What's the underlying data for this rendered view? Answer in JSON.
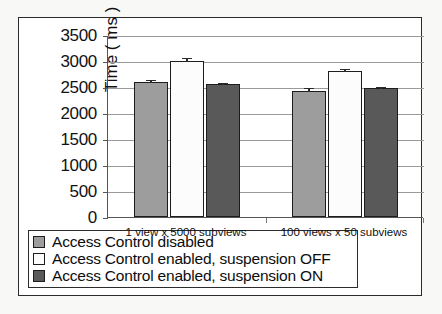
{
  "chart_data": {
    "type": "bar",
    "title": "",
    "xlabel": "",
    "ylabel": "Time ( ms )",
    "ylim": [
      0,
      3500
    ],
    "ytick_step": 500,
    "yticks": [
      "3500",
      "3000",
      "2500",
      "2000",
      "1500",
      "1000",
      "500",
      "0"
    ],
    "grid": true,
    "legend_position": "below-plot",
    "categories": [
      "1 view x 5000 subviews",
      "100 views x 50 subviews"
    ],
    "series": [
      {
        "name": "Access Control disabled",
        "color": "#9d9d9d",
        "values": [
          2600,
          2430
        ],
        "errors": [
          60,
          75
        ]
      },
      {
        "name": "Access Control enabled, suspension OFF",
        "color": "#fcfcfc",
        "values": [
          3000,
          2800
        ],
        "errors": [
          75,
          65
        ]
      },
      {
        "name": "Access Control enabled, suspension ON",
        "color": "#595959",
        "values": [
          2550,
          2480
        ],
        "errors": [
          45,
          40
        ]
      }
    ]
  },
  "legend": {
    "items": [
      {
        "label": "Access Control disabled",
        "color": "#9d9d9d"
      },
      {
        "label": "Access Control enabled, suspension OFF",
        "color": "#fcfcfc"
      },
      {
        "label": "Access Control enabled, suspension ON",
        "color": "#595959"
      }
    ]
  },
  "scan_artifacts": {
    "top_text": "scanned page bleed",
    "bottom_text": "scanned page bleed"
  }
}
